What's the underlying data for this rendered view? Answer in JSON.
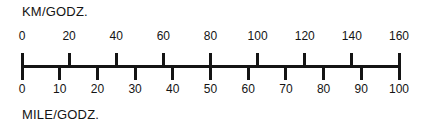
{
  "top_scale": {
    "caption": "KM/GODZ.",
    "labels": [
      "0",
      "20",
      "40",
      "60",
      "80",
      "100",
      "120",
      "140",
      "160"
    ]
  },
  "bottom_scale": {
    "caption": "MILE/GODZ.",
    "labels": [
      "0",
      "10",
      "20",
      "30",
      "40",
      "50",
      "60",
      "70",
      "80",
      "90",
      "100"
    ]
  },
  "chart_data": {
    "type": "table",
    "subtitle": "",
    "xlabel": "KM/GODZ.",
    "ylabel": "MILE/GODZ.",
    "grid": false,
    "legend_position": "none",
    "orientation": "horizontal",
    "axis_range_km": [
      0,
      160
    ],
    "axis_range_mile": [
      0,
      100
    ],
    "km_tick_interval": 20,
    "mile_tick_interval": 10,
    "km_ticks": [
      0,
      20,
      40,
      60,
      80,
      100,
      120,
      140,
      160
    ],
    "mile_ticks": [
      0,
      10,
      20,
      30,
      40,
      50,
      60,
      70,
      80,
      90,
      100
    ],
    "categories": [
      "0",
      "20",
      "40",
      "60",
      "80",
      "100",
      "120",
      "140",
      "160"
    ],
    "series": [
      {
        "name": "KM/GODZ.",
        "values": [
          0,
          20,
          40,
          60,
          80,
          100,
          120,
          140,
          160
        ]
      },
      {
        "name": "MILE/GODZ.",
        "values": [
          0,
          12.5,
          25,
          37.5,
          50,
          62.5,
          75,
          87.5,
          100
        ]
      }
    ],
    "annotations": [
      "KM/GODZ.",
      "MILE/GODZ."
    ],
    "colors": {
      "ink": "#141414",
      "background": "#ffffff"
    }
  }
}
